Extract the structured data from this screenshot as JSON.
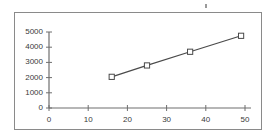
{
  "chart_data": {
    "type": "line",
    "title": "",
    "subtitle": "",
    "xlabel": "",
    "ylabel": "",
    "xlim": [
      0,
      50
    ],
    "ylim": [
      0,
      5000
    ],
    "grid": false,
    "legend": false,
    "legend_position": "none",
    "marker": "open-square",
    "line_color": "#4a4a4a",
    "marker_color": "#4a4a4a",
    "axis_color": "#6e6e6e",
    "frame_color": "#8a8a8a",
    "text_color": "#3a3a3a",
    "x_ticks": [
      0,
      10,
      20,
      30,
      40,
      50
    ],
    "x_tick_labels": [
      "0",
      "10",
      "20",
      "30",
      "40",
      "50"
    ],
    "y_ticks": [
      0,
      1000,
      2000,
      3000,
      4000,
      5000
    ],
    "y_tick_labels": [
      "0",
      "1000",
      "2000",
      "3000",
      "4000",
      "5000"
    ],
    "series": [
      {
        "name": "series-1",
        "x": [
          16,
          25,
          36,
          49
        ],
        "values": [
          2050,
          2800,
          3700,
          4750
        ]
      }
    ]
  }
}
